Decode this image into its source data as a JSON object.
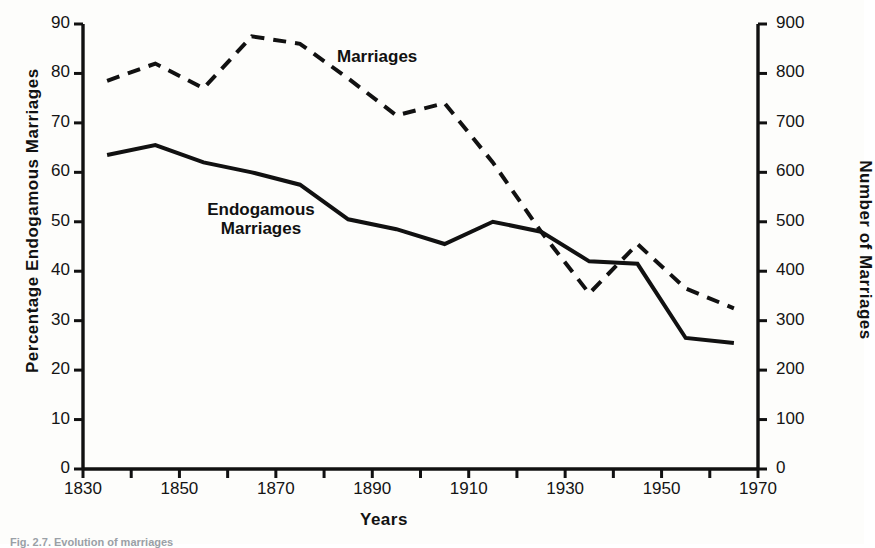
{
  "figure": {
    "caption": "Fig. 2.7. Evolution of marriages"
  },
  "axes": {
    "left_title": "Percentage Endogamous Marriages",
    "right_title": "Number of Marriages",
    "x_title": "Years",
    "left_ticks": [
      "90",
      "80",
      "70",
      "60",
      "50",
      "40",
      "30",
      "20",
      "10",
      "0"
    ],
    "right_ticks": [
      "900",
      "800",
      "700",
      "600",
      "500",
      "400",
      "300",
      "200",
      "100",
      "0"
    ],
    "x_ticks": [
      "1830",
      "1850",
      "1870",
      "1890",
      "1910",
      "1930",
      "1950",
      "1970"
    ]
  },
  "series_labels": {
    "marriages": "Marriages",
    "endogamous_line1": "Endogamous",
    "endogamous_line2": "Marriages"
  },
  "chart_data": {
    "type": "line",
    "title": "",
    "xlabel": "Years",
    "ylabel": "Percentage Endogamous Marriages",
    "y2label": "Number of Marriages",
    "xlim": [
      1830,
      1970
    ],
    "ylim": [
      0,
      90
    ],
    "y2lim": [
      0,
      900
    ],
    "xticks": [
      1830,
      1850,
      1870,
      1890,
      1910,
      1930,
      1950,
      1970
    ],
    "xticks_minor_step": 10,
    "yticks": [
      0,
      10,
      20,
      30,
      40,
      50,
      60,
      70,
      80,
      90
    ],
    "y2ticks": [
      0,
      100,
      200,
      300,
      400,
      500,
      600,
      700,
      800,
      900
    ],
    "grid": false,
    "legend": "inline-annotations",
    "series": [
      {
        "name": "Endogamous Marriages",
        "axis": "left",
        "unit": "percent",
        "style": "solid",
        "color": "#111111",
        "x": [
          1835,
          1845,
          1855,
          1865,
          1875,
          1885,
          1895,
          1905,
          1915,
          1925,
          1935,
          1945,
          1955,
          1965
        ],
        "y": [
          63.5,
          65.5,
          62.0,
          60.0,
          57.5,
          50.5,
          48.5,
          45.5,
          50.0,
          48.0,
          42.0,
          41.5,
          26.5,
          25.5
        ]
      },
      {
        "name": "Marriages",
        "axis": "right",
        "unit": "count",
        "style": "dashed",
        "color": "#111111",
        "x": [
          1835,
          1845,
          1855,
          1865,
          1875,
          1885,
          1895,
          1905,
          1915,
          1925,
          1935,
          1945,
          1955,
          1965
        ],
        "y": [
          785,
          820,
          770,
          875,
          860,
          790,
          715,
          740,
          620,
          480,
          355,
          455,
          365,
          325
        ]
      }
    ]
  }
}
